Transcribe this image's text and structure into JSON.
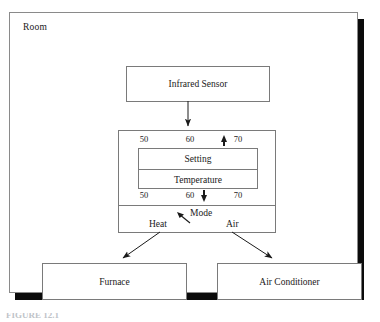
{
  "figure": {
    "room_label": "Room",
    "caption": "FIGURE 12.1",
    "colors": {
      "frame_border": "#8a8a8a",
      "box_border": "#7a7a7a",
      "shadow": "#0b0b0b",
      "text": "#1a1a1a",
      "background": "#ffffff"
    }
  },
  "nodes": {
    "sensor": {
      "label": "Infrared Sensor"
    },
    "furnace": {
      "label": "Furnace"
    },
    "air_conditioner": {
      "label": "Air Conditioner"
    }
  },
  "thermostat": {
    "setting_scale": {
      "ticks": [
        "50",
        "60",
        "70"
      ],
      "indicator": "up-arrow",
      "indicator_position": "between 60 and 70"
    },
    "temperature_scale": {
      "ticks": [
        "50",
        "60",
        "70"
      ],
      "indicator": "down-arrow",
      "indicator_position": "just right of 60"
    },
    "readout": {
      "setting_label": "Setting",
      "temperature_label": "Temperature"
    },
    "mode": {
      "label": "Mode",
      "options": [
        "Heat",
        "Air"
      ],
      "selected_indicator": "arrow pointing up-left toward Mode"
    }
  },
  "connectors": [
    {
      "name": "sensor-to-thermostat",
      "from": "Infrared Sensor",
      "to": "Thermostat",
      "style": "vertical arrow"
    },
    {
      "name": "heat-to-furnace",
      "from": "Heat",
      "to": "Furnace",
      "style": "diagonal arrow down-left"
    },
    {
      "name": "air-to-air-conditioner",
      "from": "Air",
      "to": "Air Conditioner",
      "style": "diagonal arrow down-right"
    }
  ]
}
